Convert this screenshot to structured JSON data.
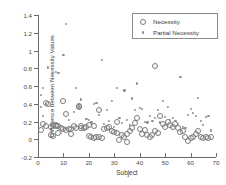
{
  "chart_data": {
    "type": "scatter",
    "title": "",
    "xlabel": "Subject",
    "ylabel": "Difference between Necessity Values",
    "xlim": [
      0,
      70
    ],
    "ylim": [
      -0.2,
      1.4
    ],
    "xticks": [
      0,
      10,
      20,
      30,
      40,
      50,
      60,
      70
    ],
    "yticks": [
      -0.2,
      0,
      0.2,
      0.4,
      0.6,
      0.8,
      1,
      1.2,
      1.4
    ],
    "ytick_labels": [
      "-0.2",
      "0",
      "0.2",
      "0.4",
      "0.6",
      "0.8",
      "1",
      "1.2",
      "1.4"
    ],
    "xtick_labels": [
      "0",
      "10",
      "20",
      "30",
      "40",
      "50",
      "60",
      "70"
    ],
    "grid": false,
    "legend_position": "top-right",
    "series": [
      {
        "name": "Necessity",
        "marker": "open-circle",
        "color": "#7b7b7b",
        "points": [
          [
            1,
            0.1
          ],
          [
            2,
            0.17
          ],
          [
            3,
            0.15
          ],
          [
            3,
            0.41
          ],
          [
            4,
            0.4
          ],
          [
            5,
            0.14
          ],
          [
            5,
            0.05
          ],
          [
            6,
            0.04
          ],
          [
            6,
            0.16
          ],
          [
            7,
            0.15
          ],
          [
            7,
            0.16
          ],
          [
            8,
            0.15
          ],
          [
            8,
            0.07
          ],
          [
            9,
            0.13
          ],
          [
            10,
            0.12
          ],
          [
            10,
            0.43
          ],
          [
            11,
            0.29
          ],
          [
            11,
            0.1
          ],
          [
            12,
            0.12
          ],
          [
            13,
            0.11
          ],
          [
            13,
            0.06
          ],
          [
            14,
            0.15
          ],
          [
            15,
            0.13
          ],
          [
            16,
            0.36
          ],
          [
            16,
            0.38
          ],
          [
            17,
            0.13
          ],
          [
            17,
            0.15
          ],
          [
            18,
            0.13
          ],
          [
            19,
            0.14
          ],
          [
            20,
            0.16
          ],
          [
            20,
            0.04
          ],
          [
            21,
            0.02
          ],
          [
            22,
            0.01
          ],
          [
            22,
            0.15
          ],
          [
            23,
            0.02
          ],
          [
            24,
            0.02
          ],
          [
            24,
            0.33
          ],
          [
            25,
            0.01
          ],
          [
            26,
            0.11
          ],
          [
            27,
            0.13
          ],
          [
            28,
            0.14
          ],
          [
            29,
            0.09
          ],
          [
            30,
            0.08
          ],
          [
            31,
            0.07
          ],
          [
            31,
            0.19
          ],
          [
            32,
            -0.01
          ],
          [
            33,
            0.05
          ],
          [
            34,
            0.03
          ],
          [
            35,
            0.06
          ],
          [
            35,
            -0.03
          ],
          [
            36,
            0.09
          ],
          [
            37,
            0.13
          ],
          [
            38,
            0.18
          ],
          [
            39,
            0.24
          ],
          [
            40,
            0.12
          ],
          [
            41,
            0.06
          ],
          [
            42,
            0.1
          ],
          [
            43,
            0.05
          ],
          [
            44,
            0.03
          ],
          [
            45,
            0.05
          ],
          [
            46,
            0.09
          ],
          [
            46,
            0.83
          ],
          [
            47,
            0.07
          ],
          [
            48,
            0.26
          ],
          [
            49,
            0.17
          ],
          [
            50,
            0.14
          ],
          [
            51,
            0.19
          ],
          [
            52,
            0.16
          ],
          [
            53,
            0.14
          ],
          [
            54,
            0.17
          ],
          [
            55,
            0.13
          ],
          [
            56,
            0.08
          ],
          [
            57,
            0.09
          ],
          [
            58,
            0.03
          ],
          [
            59,
            -0.02
          ],
          [
            60,
            0.01
          ],
          [
            61,
            0.02
          ],
          [
            62,
            0.06
          ],
          [
            63,
            0.09
          ],
          [
            64,
            0.03
          ],
          [
            65,
            0.01
          ],
          [
            66,
            0.02
          ],
          [
            67,
            0.01
          ],
          [
            68,
            0.02
          ]
        ]
      },
      {
        "name": "Partial Necessity",
        "marker": "dot",
        "color": "#8e8e8e",
        "points": [
          [
            1,
            0.5
          ],
          [
            1,
            0.36
          ],
          [
            2,
            0.58
          ],
          [
            2,
            0.26
          ],
          [
            3,
            0.4
          ],
          [
            4,
            0.81
          ],
          [
            5,
            0.17
          ],
          [
            6,
            0.75
          ],
          [
            7,
            0.76
          ],
          [
            8,
            0.75
          ],
          [
            9,
            0.07
          ],
          [
            10,
            0.95
          ],
          [
            11,
            1.3
          ],
          [
            12,
            0.22
          ],
          [
            13,
            0.14
          ],
          [
            14,
            0.31
          ],
          [
            15,
            0.58
          ],
          [
            16,
            0.37
          ],
          [
            17,
            0.45
          ],
          [
            18,
            0.12
          ],
          [
            19,
            0.23
          ],
          [
            20,
            0.22
          ],
          [
            21,
            0.19
          ],
          [
            22,
            0.4
          ],
          [
            23,
            0.41
          ],
          [
            24,
            0.27
          ],
          [
            25,
            0.89
          ],
          [
            26,
            0.17
          ],
          [
            27,
            0.33
          ],
          [
            28,
            0.21
          ],
          [
            29,
            0.43
          ],
          [
            30,
            0.14
          ],
          [
            31,
            0.58
          ],
          [
            32,
            0.24
          ],
          [
            33,
            0.18
          ],
          [
            34,
            0.55
          ],
          [
            35,
            0.22
          ],
          [
            36,
            0.16
          ],
          [
            37,
            0.46
          ],
          [
            38,
            0.33
          ],
          [
            39,
            0.63
          ],
          [
            40,
            0.35
          ],
          [
            41,
            0.34
          ],
          [
            42,
            0.2
          ],
          [
            43,
            0.19
          ],
          [
            44,
            0.26
          ],
          [
            45,
            0.21
          ],
          [
            46,
            0.24
          ],
          [
            47,
            0.33
          ],
          [
            48,
            0.19
          ],
          [
            49,
            0.43
          ],
          [
            50,
            0.25
          ],
          [
            51,
            0.36
          ],
          [
            52,
            0.22
          ],
          [
            53,
            0.24
          ],
          [
            54,
            0.21
          ],
          [
            55,
            0.17
          ],
          [
            56,
            0.7
          ],
          [
            57,
            0.14
          ],
          [
            58,
            0.13
          ],
          [
            59,
            0.27
          ],
          [
            60,
            0.34
          ],
          [
            61,
            0.3
          ],
          [
            62,
            0.26
          ],
          [
            63,
            0.47
          ],
          [
            64,
            0.21
          ],
          [
            65,
            0.16
          ],
          [
            66,
            0.25
          ],
          [
            67,
            0.26
          ],
          [
            68,
            0.1
          ]
        ]
      }
    ]
  },
  "legend": {
    "items": [
      {
        "label": "Necessity",
        "marker": "open-circle"
      },
      {
        "label": "Partial Necessity",
        "marker": "dot"
      }
    ]
  }
}
